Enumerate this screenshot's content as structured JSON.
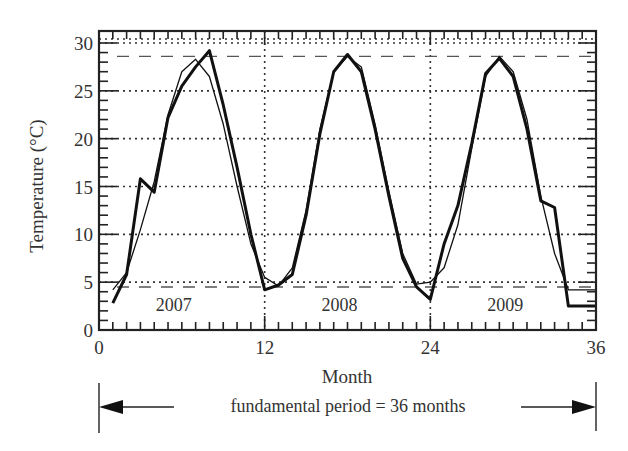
{
  "chart_data": {
    "type": "line",
    "title": "",
    "xlabel": "Month",
    "ylabel": "Temperature (°C)",
    "xlim": [
      0,
      36
    ],
    "ylim": [
      0,
      30
    ],
    "x_ticks": [
      0,
      12,
      24,
      36
    ],
    "x_tick_labels": [
      "0",
      "12",
      "24",
      "36"
    ],
    "y_ticks": [
      0,
      5,
      10,
      15,
      20,
      25,
      30
    ],
    "y_tick_labels": [
      "0",
      "5",
      "10",
      "15",
      "20",
      "25",
      "30"
    ],
    "x_minor_tick_step": 1,
    "y_minor_tick_step": 1,
    "grid": {
      "horizontal_dotted_at": [
        5,
        10,
        15,
        20,
        25,
        30
      ],
      "vertical_dotted_at": [
        12,
        24
      ]
    },
    "reference_lines": [
      {
        "name": "max-reference",
        "y": 28.6,
        "style": "dashed"
      },
      {
        "name": "min-reference",
        "y": 4.5,
        "style": "dashed"
      }
    ],
    "year_labels": [
      {
        "text": "2007",
        "x": 6
      },
      {
        "text": "2008",
        "x": 18
      },
      {
        "text": "2009",
        "x": 30
      }
    ],
    "series": [
      {
        "name": "measured",
        "style": "thick",
        "x": [
          1,
          2,
          3,
          4,
          5,
          6,
          7,
          8,
          9,
          10,
          11,
          12,
          13,
          14,
          15,
          16,
          17,
          18,
          19,
          20,
          21,
          22,
          23,
          24,
          25,
          26,
          27,
          28,
          29,
          30,
          31,
          32,
          33,
          34,
          35,
          36
        ],
        "values": [
          2.8,
          5.8,
          15.8,
          14.4,
          22.2,
          25.5,
          27.5,
          29.2,
          23.5,
          17.0,
          10.0,
          4.2,
          4.7,
          5.8,
          12.0,
          20.5,
          27.0,
          28.8,
          27.0,
          21.0,
          14.0,
          7.5,
          4.5,
          3.2,
          9.0,
          13.0,
          19.5,
          26.8,
          28.4,
          26.5,
          21.0,
          13.5,
          12.8,
          2.5,
          2.5,
          2.5
        ]
      },
      {
        "name": "fitted",
        "style": "thin",
        "x": [
          1,
          2,
          3,
          4,
          5,
          6,
          7,
          8,
          9,
          10,
          11,
          12,
          13,
          14,
          15,
          16,
          17,
          18,
          19,
          20,
          21,
          22,
          23,
          24,
          25,
          26,
          27,
          28,
          29,
          30,
          31,
          32,
          33,
          34,
          35,
          36
        ],
        "values": [
          4.2,
          6.0,
          10.5,
          15.5,
          22.5,
          27.0,
          28.3,
          26.5,
          21.5,
          15.0,
          9.0,
          5.5,
          4.6,
          6.5,
          12.5,
          21.0,
          27.0,
          28.6,
          27.5,
          21.5,
          14.5,
          8.0,
          4.8,
          5.0,
          6.5,
          11.0,
          19.0,
          26.5,
          28.6,
          27.0,
          22.0,
          14.0,
          8.0,
          4.2,
          4.2,
          4.2
        ]
      }
    ],
    "annotation": {
      "text": "fundamental period = 36 months",
      "arrow_from": 0,
      "arrow_to": 36
    }
  }
}
